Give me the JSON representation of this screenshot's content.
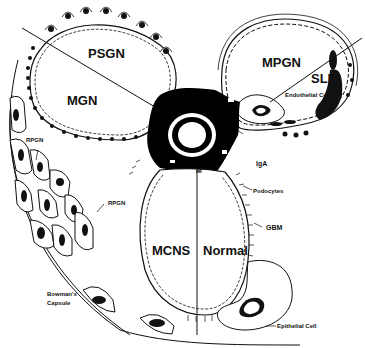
{
  "figure": {
    "colors": {
      "ink": "#111111",
      "background": "#ffffff",
      "fill_dark": "#000000"
    }
  },
  "labels": {
    "psgn": "PSGN",
    "mgn": "MGN",
    "mpgn": "MPGN",
    "sle": "SLE",
    "mcns": "MCNS",
    "normal": "Normal",
    "mesangium": "M",
    "iga": "IgA",
    "podocytes": "Podocytes",
    "gbm": "GBM",
    "endothelial_cell": "Endothelial Cell",
    "epithelial_cell": "Epithelial Cell",
    "rpgn_upper": "RPGN",
    "rpgn_lower": "RPGN",
    "bowmans_capsule_line1": "Bowman's",
    "bowmans_capsule_line2": "Capsule"
  }
}
